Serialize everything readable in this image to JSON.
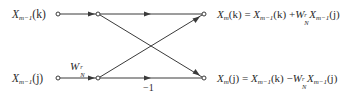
{
  "diagram": {
    "type": "butterfly-signal-flow-graph",
    "inputs": {
      "top": {
        "base": "X",
        "sub": "m−1",
        "arg": "(k)"
      },
      "bottom": {
        "base": "X",
        "sub": "m−1",
        "arg": "(j)"
      }
    },
    "twiddle_label": {
      "base": "W",
      "sup": "r",
      "sub": "N"
    },
    "branch_gain_label": "−1",
    "outputs": {
      "top": {
        "lhs": {
          "base": "X",
          "sub": "m",
          "arg": "(k)"
        },
        "eq": " = ",
        "t1": {
          "base": "X",
          "sub": "m−1",
          "arg": "(k)"
        },
        "op": " +",
        "w": {
          "base": "W",
          "sup": "r",
          "sub": "N"
        },
        "t2": {
          "base": "X",
          "sub": "m−1",
          "arg": "(j)"
        }
      },
      "bottom": {
        "lhs": {
          "base": "X",
          "sub": "m",
          "arg": "(j)"
        },
        "eq": " = ",
        "t1": {
          "base": "X",
          "sub": "m−1",
          "arg": "(k)"
        },
        "op": " −",
        "w": {
          "base": "W",
          "sup": "r",
          "sub": "N"
        },
        "t2": {
          "base": "X",
          "sub": "m−1",
          "arg": "(j)"
        }
      }
    },
    "colors": {
      "line": "#3a3a3a",
      "text": "#2a2a2a",
      "background": "#ffffff"
    }
  }
}
